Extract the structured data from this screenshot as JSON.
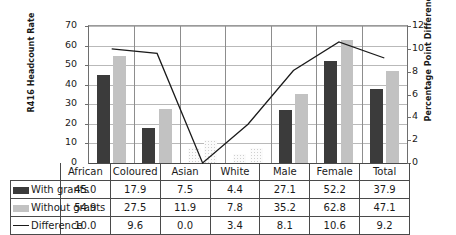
{
  "chart_data": {
    "type": "bar",
    "title": "",
    "subtitle": "",
    "xlabel": "",
    "ylabel": "R416 Headcount Rate",
    "y2label": "Percentage Point Difference",
    "categories": [
      "African",
      "Coloured",
      "Asian",
      "White",
      "Male",
      "Female",
      "Total"
    ],
    "series": [
      {
        "name": "With grants",
        "type": "bar",
        "axis": "left",
        "values": [
          45.0,
          17.9,
          7.5,
          4.4,
          27.1,
          52.2,
          37.9
        ],
        "color": "#3b3b3b"
      },
      {
        "name": "Without grants",
        "type": "bar",
        "axis": "left",
        "values": [
          54.9,
          27.5,
          11.9,
          7.8,
          35.2,
          62.8,
          47.1
        ],
        "color": "#c2c2c2"
      },
      {
        "name": "Difference",
        "type": "line",
        "axis": "right",
        "values": [
          10.0,
          9.6,
          0.0,
          3.4,
          8.1,
          10.6,
          9.2
        ],
        "color": "#1a1a1a"
      }
    ],
    "ylim": [
      0,
      70
    ],
    "yticks": [
      0,
      10,
      20,
      30,
      40,
      50,
      60,
      70
    ],
    "y2lim": [
      0,
      12
    ],
    "y2ticks": [
      0,
      2,
      4,
      6,
      8,
      10,
      12
    ],
    "grid": true,
    "legend_position": "data-table-left"
  },
  "table": {
    "corner_label": "",
    "column_headers": [
      "African",
      "Coloured",
      "Asian",
      "White",
      "Male",
      "Female",
      "Total"
    ],
    "rows": [
      {
        "label": "With grants",
        "swatch": "with-grants-swatch",
        "values": [
          "45.0",
          "17.9",
          "7.5",
          "4.4",
          "27.1",
          "52.2",
          "37.9"
        ]
      },
      {
        "label": "Without grants",
        "swatch": "without-grants-swatch",
        "values": [
          "54.9",
          "27.5",
          "11.9",
          "7.8",
          "35.2",
          "62.8",
          "47.1"
        ]
      },
      {
        "label": "Difference",
        "swatch": "difference-line-swatch",
        "values": [
          "10.0",
          "9.6",
          "0.0",
          "3.4",
          "8.1",
          "10.6",
          "9.2"
        ]
      }
    ]
  },
  "axes": {
    "left_title": "R416 Headcount Rate",
    "right_title": "Percentage Point Difference",
    "left_ticks": [
      "70",
      "60",
      "50",
      "40",
      "30",
      "20",
      "10",
      "0"
    ],
    "right_ticks": [
      "12",
      "10",
      "8",
      "6",
      "4",
      "2",
      "0"
    ]
  }
}
